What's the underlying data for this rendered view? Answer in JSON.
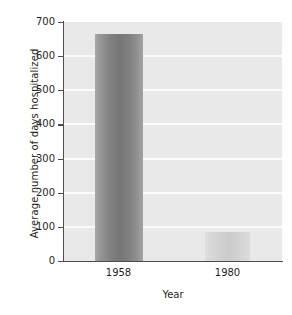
{
  "chart_data": {
    "type": "bar",
    "title": "",
    "subtitle": "",
    "xlabel": "Year",
    "ylabel": "Average number of days hospitalized",
    "categories": [
      "1958",
      "1980"
    ],
    "values": [
      665,
      85
    ],
    "series": [
      {
        "name": "Average number of days hospitalized",
        "values": [
          665,
          85
        ]
      }
    ],
    "ylim": [
      0,
      700
    ],
    "yticks": [
      0,
      100,
      200,
      300,
      400,
      500,
      600,
      700
    ],
    "ytick_labels": [
      "0",
      "100",
      "200",
      "300",
      "400",
      "500",
      "600",
      "700"
    ],
    "xtick_labels": [
      "1958",
      "1980"
    ],
    "grid": true,
    "grid_orientation": "horizontal",
    "grid_color": "#fbfbfb",
    "legend": false,
    "legend_position": "none",
    "plot_background": "#e9e9e9",
    "figure_background": "#ffffff",
    "axis_color": "#4d4d4d",
    "text_color": "#231f20",
    "bar_colors": [
      "#7e7e7e",
      "#d2d2d2"
    ],
    "annotations": []
  }
}
